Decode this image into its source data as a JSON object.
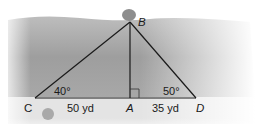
{
  "diagram": {
    "points": {
      "B": {
        "label": "B"
      },
      "C": {
        "label": "C"
      },
      "A": {
        "label": "A"
      },
      "D": {
        "label": "D"
      }
    },
    "angles": {
      "C": "40°",
      "D": "50°"
    },
    "segments": {
      "CA": "50 yd",
      "AD": "35 yd"
    },
    "right_angle_at": "A",
    "colors": {
      "water": "#a9a9a9",
      "ground": "#e6e6e6",
      "line": "#1a1a1a",
      "rock": "#8f8f8f"
    }
  }
}
